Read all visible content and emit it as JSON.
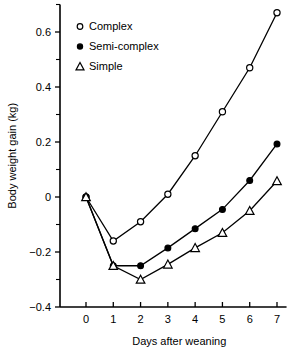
{
  "chart_data": {
    "type": "line",
    "title": "",
    "xlabel": "Days after weaning",
    "ylabel": "Body weight gain (kg)",
    "xlim": [
      -0.7,
      7.4
    ],
    "ylim": [
      -0.4,
      0.7
    ],
    "xticks": [
      0,
      1,
      2,
      3,
      4,
      5,
      6,
      7
    ],
    "xticklabels": [
      "0",
      "1",
      "2",
      "3",
      "4",
      "5",
      "6",
      "7"
    ],
    "yticks": [
      -0.4,
      -0.2,
      0,
      0.2,
      0.4,
      0.6
    ],
    "yticklabels": [
      "-0.4",
      "-0.2",
      "0",
      "0.2",
      "0.4",
      "0.6"
    ],
    "yminorticks": [
      -0.3,
      -0.1,
      0.1,
      0.3,
      0.5,
      0.7
    ],
    "grid": false,
    "legend_position": "upper-left",
    "series": [
      {
        "name": "Complex",
        "marker": "open-circle",
        "x": [
          0,
          1,
          2,
          3,
          4,
          5,
          6,
          7
        ],
        "values": [
          0.0,
          -0.16,
          -0.09,
          0.01,
          0.15,
          0.31,
          0.47,
          0.67
        ]
      },
      {
        "name": "Semi-complex",
        "marker": "filled-circle",
        "x": [
          0,
          1,
          2,
          3,
          4,
          5,
          6,
          7
        ],
        "values": [
          0.0,
          -0.25,
          -0.25,
          -0.185,
          -0.115,
          -0.045,
          0.06,
          0.193
        ]
      },
      {
        "name": "Simple",
        "marker": "open-triangle",
        "x": [
          0,
          1,
          2,
          3,
          4,
          5,
          6,
          7
        ],
        "values": [
          0.0,
          -0.25,
          -0.3,
          -0.245,
          -0.185,
          -0.13,
          -0.05,
          0.058
        ]
      }
    ]
  },
  "legend": {
    "entries": [
      {
        "label": "Complex",
        "marker": "open-circle"
      },
      {
        "label": "Semi-complex",
        "marker": "filled-circle"
      },
      {
        "label": "Simple",
        "marker": "open-triangle"
      }
    ]
  },
  "colors": {
    "foreground": "#000000",
    "background": "#ffffff"
  }
}
